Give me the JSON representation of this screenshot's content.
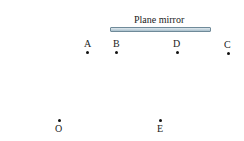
{
  "mirror": {
    "label": "Plane mirror",
    "color": "#a9c0cc"
  },
  "points": [
    {
      "name": "A",
      "x": 87,
      "y": 52
    },
    {
      "name": "B",
      "x": 116,
      "y": 52
    },
    {
      "name": "D",
      "x": 177,
      "y": 52
    },
    {
      "name": "C",
      "x": 228,
      "y": 53
    },
    {
      "name": "O",
      "x": 59,
      "y": 121
    },
    {
      "name": "E",
      "x": 160,
      "y": 121
    }
  ]
}
